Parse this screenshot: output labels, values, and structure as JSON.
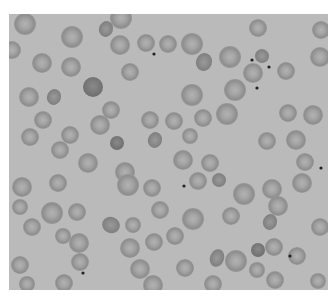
{
  "image": {
    "subject": "Blood smear micrograph showing red blood cells",
    "background_color": "#bababa",
    "border_color": "#ffffff",
    "cell_edge_color": "#8c8c8c",
    "cell_center_color": "#aaaaaa",
    "dark_cell_color": "#7a7a7a",
    "dot_color": "#222222"
  },
  "cells": [
    {
      "x": 25,
      "y": 24,
      "r": 11
    },
    {
      "x": 72,
      "y": 37,
      "r": 11
    },
    {
      "x": 121,
      "y": 18,
      "r": 11
    },
    {
      "x": 12,
      "y": 50,
      "r": 9
    },
    {
      "x": 42,
      "y": 63,
      "r": 10
    },
    {
      "x": 71,
      "y": 67,
      "r": 10
    },
    {
      "x": 120,
      "y": 45,
      "r": 10
    },
    {
      "x": 146,
      "y": 43,
      "r": 9
    },
    {
      "x": 168,
      "y": 44,
      "r": 9
    },
    {
      "x": 192,
      "y": 44,
      "r": 11
    },
    {
      "x": 230,
      "y": 57,
      "r": 11
    },
    {
      "x": 258,
      "y": 28,
      "r": 9
    },
    {
      "x": 253,
      "y": 73,
      "r": 10
    },
    {
      "x": 286,
      "y": 71,
      "r": 9
    },
    {
      "x": 321,
      "y": 30,
      "r": 9
    },
    {
      "x": 320,
      "y": 57,
      "r": 10
    },
    {
      "x": 130,
      "y": 72,
      "r": 9
    },
    {
      "x": 29,
      "y": 97,
      "r": 10
    },
    {
      "x": 192,
      "y": 95,
      "r": 11
    },
    {
      "x": 235,
      "y": 90,
      "r": 11
    },
    {
      "x": 111,
      "y": 110,
      "r": 9
    },
    {
      "x": 43,
      "y": 120,
      "r": 9
    },
    {
      "x": 100,
      "y": 125,
      "r": 10
    },
    {
      "x": 150,
      "y": 120,
      "r": 9
    },
    {
      "x": 174,
      "y": 121,
      "r": 9
    },
    {
      "x": 203,
      "y": 118,
      "r": 9
    },
    {
      "x": 227,
      "y": 114,
      "r": 11
    },
    {
      "x": 288,
      "y": 113,
      "r": 9
    },
    {
      "x": 313,
      "y": 115,
      "r": 10
    },
    {
      "x": 30,
      "y": 137,
      "r": 9
    },
    {
      "x": 70,
      "y": 135,
      "r": 9
    },
    {
      "x": 190,
      "y": 136,
      "r": 8
    },
    {
      "x": 267,
      "y": 141,
      "r": 9
    },
    {
      "x": 296,
      "y": 140,
      "r": 10
    },
    {
      "x": 60,
      "y": 150,
      "r": 9
    },
    {
      "x": 88,
      "y": 163,
      "r": 10
    },
    {
      "x": 125,
      "y": 172,
      "r": 10
    },
    {
      "x": 183,
      "y": 160,
      "r": 10
    },
    {
      "x": 210,
      "y": 163,
      "r": 9
    },
    {
      "x": 305,
      "y": 162,
      "r": 9
    },
    {
      "x": 302,
      "y": 183,
      "r": 10
    },
    {
      "x": 22,
      "y": 187,
      "r": 10
    },
    {
      "x": 58,
      "y": 183,
      "r": 9
    },
    {
      "x": 20,
      "y": 207,
      "r": 8
    },
    {
      "x": 52,
      "y": 213,
      "r": 11
    },
    {
      "x": 77,
      "y": 212,
      "r": 9
    },
    {
      "x": 128,
      "y": 185,
      "r": 11
    },
    {
      "x": 152,
      "y": 188,
      "r": 9
    },
    {
      "x": 198,
      "y": 181,
      "r": 9
    },
    {
      "x": 244,
      "y": 194,
      "r": 11
    },
    {
      "x": 272,
      "y": 189,
      "r": 10
    },
    {
      "x": 231,
      "y": 216,
      "r": 9
    },
    {
      "x": 160,
      "y": 210,
      "r": 9
    },
    {
      "x": 193,
      "y": 219,
      "r": 11
    },
    {
      "x": 278,
      "y": 206,
      "r": 10
    },
    {
      "x": 32,
      "y": 227,
      "r": 9
    },
    {
      "x": 63,
      "y": 236,
      "r": 8
    },
    {
      "x": 133,
      "y": 225,
      "r": 8
    },
    {
      "x": 79,
      "y": 243,
      "r": 10
    },
    {
      "x": 130,
      "y": 248,
      "r": 10
    },
    {
      "x": 154,
      "y": 242,
      "r": 9
    },
    {
      "x": 175,
      "y": 236,
      "r": 9
    },
    {
      "x": 236,
      "y": 261,
      "r": 11
    },
    {
      "x": 274,
      "y": 247,
      "r": 9
    },
    {
      "x": 297,
      "y": 256,
      "r": 9
    },
    {
      "x": 257,
      "y": 270,
      "r": 8
    },
    {
      "x": 320,
      "y": 227,
      "r": 9
    },
    {
      "x": 20,
      "y": 265,
      "r": 9
    },
    {
      "x": 80,
      "y": 262,
      "r": 9
    },
    {
      "x": 140,
      "y": 269,
      "r": 10
    },
    {
      "x": 185,
      "y": 268,
      "r": 9
    },
    {
      "x": 27,
      "y": 284,
      "r": 8
    },
    {
      "x": 64,
      "y": 283,
      "r": 9
    },
    {
      "x": 153,
      "y": 285,
      "r": 10
    },
    {
      "x": 213,
      "y": 284,
      "r": 9
    },
    {
      "x": 275,
      "y": 280,
      "r": 9
    },
    {
      "x": 318,
      "y": 281,
      "r": 8
    }
  ],
  "dark_cells": [
    {
      "x": 93,
      "y": 87,
      "r": 10
    },
    {
      "x": 117,
      "y": 143,
      "r": 7
    },
    {
      "x": 258,
      "y": 250,
      "r": 7
    }
  ],
  "irregular_cells": [
    {
      "x": 106,
      "y": 29,
      "rx": 7,
      "ry": 8
    },
    {
      "x": 204,
      "y": 62,
      "rx": 8,
      "ry": 9
    },
    {
      "x": 262,
      "y": 56,
      "rx": 7,
      "ry": 7
    },
    {
      "x": 54,
      "y": 97,
      "rx": 7,
      "ry": 8
    },
    {
      "x": 155,
      "y": 140,
      "rx": 7,
      "ry": 8
    },
    {
      "x": 219,
      "y": 180,
      "rx": 7,
      "ry": 7
    },
    {
      "x": 111,
      "y": 225,
      "rx": 9,
      "ry": 8
    },
    {
      "x": 217,
      "y": 258,
      "rx": 7,
      "ry": 9
    },
    {
      "x": 270,
      "y": 222,
      "rx": 7,
      "ry": 8
    }
  ],
  "dots": [
    {
      "x": 154,
      "y": 54
    },
    {
      "x": 252,
      "y": 60
    },
    {
      "x": 269,
      "y": 67
    },
    {
      "x": 257,
      "y": 88
    },
    {
      "x": 184,
      "y": 186
    },
    {
      "x": 83,
      "y": 273
    },
    {
      "x": 290,
      "y": 256
    },
    {
      "x": 321,
      "y": 168
    }
  ]
}
